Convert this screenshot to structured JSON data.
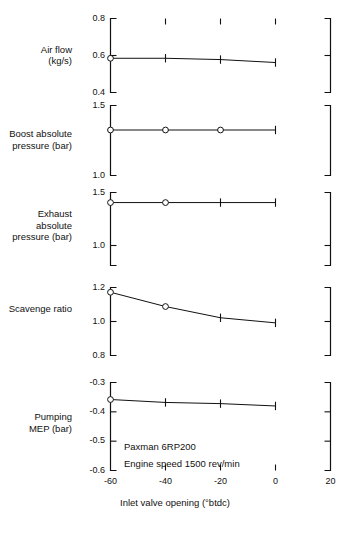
{
  "chart_data": {
    "type": "line",
    "title": "",
    "xlabel": "Inlet valve opening (°btdc)",
    "xlim": [
      -60,
      20
    ],
    "xticks": [
      -60,
      -40,
      -20,
      0,
      20
    ],
    "xticklabels": [
      "-60",
      "-40",
      "-20",
      "0",
      "20"
    ],
    "grid": false,
    "legend": null,
    "annotations": [
      "Paxman 6RP200",
      "Engine speed 1500 rev/min"
    ],
    "panels": [
      {
        "id": "air-flow",
        "ylabel": "Air flow\n(kg/s)",
        "ylabel_line1": "Air flow",
        "ylabel_line2": "(kg/s)",
        "ylim": [
          0.4,
          0.8
        ],
        "yticks": [
          0.4,
          0.6,
          0.8
        ],
        "yticklabels": [
          "0.4",
          "0.6",
          "0.8"
        ],
        "x": [
          -60,
          -40,
          -20,
          0
        ],
        "values": [
          0.585,
          0.585,
          0.578,
          0.562
        ],
        "markers": [
          "circle",
          "plus",
          "plus",
          "plus"
        ]
      },
      {
        "id": "boost-absolute-pressure",
        "ylabel": "Boost absolute\npressure (bar)",
        "ylabel_line1": "Boost absolute",
        "ylabel_line2": "pressure (bar)",
        "ylim": [
          1.0,
          1.5
        ],
        "yticks": [
          1.0,
          1.5
        ],
        "yticklabels": [
          "1.0",
          "1.5"
        ],
        "x": [
          -60,
          -40,
          -20,
          0
        ],
        "values": [
          1.325,
          1.325,
          1.325,
          1.325
        ],
        "markers": [
          "circle",
          "circle",
          "circle",
          "plus"
        ]
      },
      {
        "id": "exhaust-absolute-pressure",
        "ylabel": "Exhaust absolute\npressure (bar)",
        "ylabel_line1": "Exhaust absolute",
        "ylabel_line2": "pressure (bar)",
        "ylim": [
          1.0,
          1.5
        ],
        "yticks": [
          1.0,
          1.5
        ],
        "yticklabels": [
          "1.0",
          "1.5"
        ],
        "x": [
          -60,
          -40,
          -20,
          0
        ],
        "values": [
          1.405,
          1.405,
          1.405,
          1.405
        ],
        "markers": [
          "circle",
          "circle",
          "plus",
          "plus"
        ]
      },
      {
        "id": "scavenge-ratio",
        "ylabel": "Scavenge ratio",
        "ylabel_line1": "Scavenge ratio",
        "ylabel_line2": "",
        "ylim": [
          0.8,
          1.2
        ],
        "yticks": [
          0.8,
          1.0,
          1.2
        ],
        "yticklabels": [
          "0.8",
          "1.0",
          "1.2"
        ],
        "x": [
          -60,
          -40,
          -20,
          0
        ],
        "values": [
          1.172,
          1.088,
          1.022,
          0.992
        ],
        "markers": [
          "circle",
          "circle",
          "plus",
          "plus"
        ]
      },
      {
        "id": "pumping-mep",
        "ylabel": "Pumping\nMEP (bar)",
        "ylabel_line1": "Pumping",
        "ylabel_line2": "MEP (bar)",
        "ylim": [
          -0.6,
          -0.3
        ],
        "yticks": [
          -0.6,
          -0.5,
          -0.4,
          -0.3
        ],
        "yticklabels": [
          "-0.6",
          "-0.5",
          "-0.4",
          "-0.3"
        ],
        "x": [
          -60,
          -40,
          -20,
          0
        ],
        "values": [
          -0.358,
          -0.368,
          -0.372,
          -0.38
        ],
        "markers": [
          "circle",
          "plus",
          "plus",
          "plus"
        ]
      }
    ]
  },
  "figure": {
    "background_color": "#ffffff",
    "ink_color": "#111111"
  }
}
